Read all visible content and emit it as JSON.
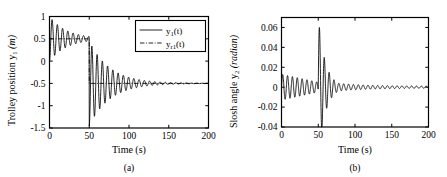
{
  "figure": {
    "panels": [
      {
        "id": "a",
        "caption": "(a)",
        "xlabel": "Time (s)",
        "ylabel_main": "Trolley position y",
        "ylabel_sub": "1",
        "ylabel_unit": "(m)",
        "xticks": [
          "0",
          "50",
          "100",
          "150",
          "200"
        ],
        "yticks": [
          "1",
          "0.5",
          "0",
          "-0.5",
          "-1",
          "-1.5"
        ],
        "legend": [
          {
            "label_main": "y",
            "label_sub": "1",
            "label_tail": "(t)",
            "style": "solid"
          },
          {
            "label_main": "y",
            "label_sub": "r1",
            "label_tail": "(t)",
            "style": "dashdot"
          }
        ]
      },
      {
        "id": "b",
        "caption": "(b)",
        "xlabel": "Time (s)",
        "ylabel_main": "Slosh angle y",
        "ylabel_sub": "2",
        "ylabel_unit": "(radian)",
        "xticks": [
          "0",
          "50",
          "100",
          "150",
          "200"
        ],
        "yticks": [
          "0.06",
          "0.04",
          "0.02",
          "0",
          "-0.02",
          "-0.04"
        ],
        "legend": []
      }
    ]
  },
  "chart_data": [
    {
      "type": "line",
      "panel": "a",
      "title": "(a)",
      "xlabel": "Time (s)",
      "ylabel": "Trolley position y1 (m)",
      "xlim": [
        0,
        200
      ],
      "ylim": [
        -1.5,
        1.0
      ],
      "xticks": [
        0,
        50,
        100,
        150,
        200
      ],
      "yticks": [
        1,
        0.5,
        0,
        -0.5,
        -1,
        -1.5
      ],
      "grid": false,
      "legend_position": "upper-right",
      "series": [
        {
          "name": "y1(t)",
          "style": "solid",
          "description": "Trolley position response: damped oscillation about setpoint 0.5 m for 0<=t<50 with initial overshoot to 1.0 m, then step change of setpoint to -0.5 m at t=50 s producing large undershoot to -1.45 m near t=57 s, decaying oscillation settling at -0.5 m by t=150 s",
          "oscillation_period_s": 6.6,
          "segments": [
            {
              "t_start": 0,
              "t_end": 50,
              "setpoint": 0.5,
              "peak": 1.0,
              "trough": 0.02,
              "decay_tau_s": 22
            },
            {
              "t_start": 50,
              "t_end": 200,
              "setpoint": -0.5,
              "peak": 0.42,
              "trough": -1.45,
              "decay_tau_s": 26
            }
          ]
        },
        {
          "name": "yr1(t)",
          "style": "dashdot",
          "description": "Reference signal: constant 0.5 m for 0<=t<50, step to -0.5 m for t>=50",
          "points": [
            [
              0,
              0.5
            ],
            [
              50,
              0.5
            ],
            [
              50,
              -0.5
            ],
            [
              200,
              -0.5
            ]
          ]
        }
      ]
    },
    {
      "type": "line",
      "panel": "b",
      "title": "(b)",
      "xlabel": "Time (s)",
      "ylabel": "Slosh angle y2 (radian)",
      "xlim": [
        0,
        200
      ],
      "ylim": [
        -0.04,
        0.07
      ],
      "xticks": [
        0,
        50,
        100,
        150,
        200
      ],
      "yticks": [
        0.06,
        0.04,
        0.02,
        0,
        -0.02,
        -0.04
      ],
      "grid": false,
      "legend_position": "none",
      "series": [
        {
          "name": "y2(t)",
          "style": "solid",
          "description": "Slosh angle response: small damped oscillation of amplitude ~0.013 rad decaying toward ~0.004 rad over 0<=t<50, large transient spike to 0.071 rad at t=52 s then to -0.031 rad at t=57 s following the setpoint step, decaying oscillation approaching 0 rad by t=160 s",
          "oscillation_period_s": 6.6,
          "segments": [
            {
              "t_start": 0,
              "t_end": 50,
              "amplitude_start": 0.013,
              "amplitude_end": 0.005,
              "center": 0.0
            },
            {
              "t_start": 50,
              "t_end": 200,
              "peak": 0.071,
              "trough": -0.031,
              "amplitude_end": 0.001,
              "center": 0.0
            }
          ]
        }
      ]
    }
  ]
}
